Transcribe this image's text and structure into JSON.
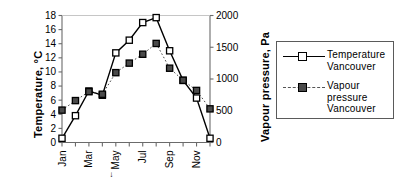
{
  "chart_data": {
    "type": "line",
    "title": "",
    "xlabel": "",
    "categories": [
      "Jan",
      "Feb",
      "Mar",
      "Apr",
      "May",
      "Jun",
      "Jul",
      "Aug",
      "Sep",
      "Oct",
      "Nov",
      "Dec"
    ],
    "xtick_labels": [
      "Jan",
      "Mar",
      "May",
      "Jul",
      "Sep",
      "Nov"
    ],
    "xtick_indices": [
      0,
      2,
      4,
      6,
      8,
      10
    ],
    "grid": false,
    "legend_position": "right-outside",
    "axes": [
      {
        "id": "left",
        "label": "Temperature, °C",
        "ylim": [
          0,
          18
        ],
        "ticks": [
          0,
          2,
          4,
          6,
          8,
          10,
          12,
          14,
          16,
          18
        ],
        "tick_labels": [
          "0",
          "2",
          "4",
          "6",
          "8",
          "10",
          "12",
          "14",
          "16",
          "18"
        ]
      },
      {
        "id": "right",
        "label": "Vapour pressure, Pa",
        "ylim": [
          0,
          2000
        ],
        "ticks": [
          0,
          500,
          1000,
          1500,
          2000
        ],
        "tick_labels": [
          "0",
          "500",
          "1000",
          "1500",
          "2000"
        ]
      }
    ],
    "series": [
      {
        "name": "Temperature Vancouver",
        "legend_label": "Temperature Vancouver",
        "axis": "left",
        "linestyle": "solid",
        "marker": "open-square",
        "color": "#000000",
        "values": [
          0.6,
          3.8,
          7.3,
          6.7,
          12.7,
          14.5,
          17.0,
          17.7,
          13.0,
          8.8,
          6.3,
          0.6
        ]
      },
      {
        "name": "Vapour pressure Vancouver",
        "legend_label": "Vapour pressure Vancouver",
        "axis": "right",
        "linestyle": "dotted",
        "marker": "filled-square",
        "color": "#4a4a4a",
        "values": [
          510,
          660,
          800,
          760,
          1100,
          1250,
          1390,
          1560,
          1170,
          980,
          820,
          530
        ]
      }
    ],
    "annotations": [
      {
        "text": "↓",
        "near": "May",
        "description": "small arrow mark left of May tick label"
      }
    ]
  },
  "legend": {
    "entries": [
      {
        "label_lines": [
          "Temperature",
          "Vancouver"
        ]
      },
      {
        "label_lines": [
          "Vapour",
          "pressure",
          "Vancouver"
        ]
      }
    ]
  }
}
